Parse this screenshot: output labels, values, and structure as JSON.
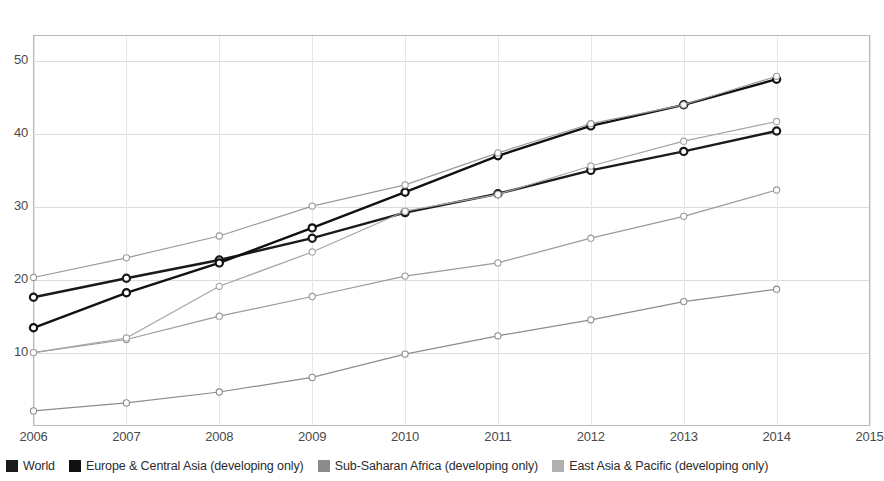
{
  "chart_data": {
    "type": "line",
    "title": "",
    "subtitle": "",
    "xlabel": "",
    "ylabel": "",
    "x": [
      2006,
      2007,
      2008,
      2009,
      2010,
      2011,
      2012,
      2013,
      2014
    ],
    "xtick_labels": [
      "2006",
      "2007",
      "2008",
      "2009",
      "2010",
      "2011",
      "2012",
      "2013",
      "2015"
    ],
    "xticks": [
      2006,
      2007,
      2008,
      2009,
      2010,
      2011,
      2012,
      2013,
      2014,
      2015
    ],
    "xtick_labels_full": [
      "2006",
      "2007",
      "2008",
      "2009",
      "2010",
      "2011",
      "2012",
      "2013",
      "2014",
      "2015"
    ],
    "xlim": [
      2006,
      2015
    ],
    "ylim": [
      0,
      53.5
    ],
    "yticks": [
      10,
      20,
      30,
      40,
      50
    ],
    "ytick_labels": [
      "10",
      "20",
      "30",
      "40",
      "50"
    ],
    "grid": true,
    "grid_axis": "y",
    "legend_position": "bottom",
    "marker": "circle-open",
    "series": [
      {
        "name": "World",
        "color": "#1a1a1a",
        "line_width": 2.4,
        "values": [
          17.6,
          20.2,
          22.7,
          25.7,
          29.2,
          31.8,
          35.0,
          37.6,
          40.4
        ]
      },
      {
        "name": "Europe & Central Asia (developing only)",
        "color": "#111111",
        "line_width": 2.4,
        "values": [
          13.4,
          18.2,
          22.3,
          27.1,
          32.0,
          37.0,
          41.1,
          44.0,
          47.5
        ]
      },
      {
        "name": "Sub-Saharan Africa (developing only)",
        "color": "#8c8c8c",
        "line_width": 1.2,
        "values": [
          2.0,
          3.1,
          4.6,
          6.6,
          9.8,
          12.3,
          14.5,
          17.0,
          18.7
        ]
      },
      {
        "name": "East Asia & Pacific (developing only)",
        "color": "#9a9a9a",
        "line_width": 1.2,
        "values": [
          10.0,
          11.8,
          15.0,
          17.7,
          20.5,
          22.3,
          25.7,
          28.7,
          32.3
        ]
      },
      {
        "name": "Series 5",
        "color": "#9a9a9a",
        "line_width": 1.2,
        "hidden_from_legend": true,
        "values": [
          20.3,
          23.0,
          26.0,
          30.1,
          33.0,
          37.4,
          41.4,
          44.0,
          47.9
        ]
      },
      {
        "name": "Series 6",
        "color": "#a5a5a5",
        "line_width": 1.2,
        "hidden_from_legend": true,
        "values": [
          10.0,
          12.0,
          19.1,
          23.8,
          29.4,
          31.7,
          35.6,
          39.0,
          41.7
        ]
      }
    ]
  },
  "legend": {
    "items": [
      {
        "label": "World",
        "color": "#1a1a1a"
      },
      {
        "label": "Europe & Central Asia (developing only)",
        "color": "#111111"
      },
      {
        "label": "Sub-Saharan Africa (developing only)",
        "color": "#8c8c8c"
      },
      {
        "label": "East Asia & Pacific (developing only)",
        "color": "#b0b0b0"
      }
    ]
  },
  "axes": {
    "y_tick_labels": [
      "50",
      "40",
      "30",
      "20",
      "10"
    ],
    "x_tick_labels": [
      "2006",
      "2007",
      "2008",
      "2009",
      "2010",
      "2011",
      "2012",
      "2013",
      "2014",
      "2015"
    ]
  },
  "colors": {
    "frame": "#b8b8b8",
    "grid": "#dcdcdc",
    "background": "#ffffff",
    "text": "#4a4a4a"
  }
}
